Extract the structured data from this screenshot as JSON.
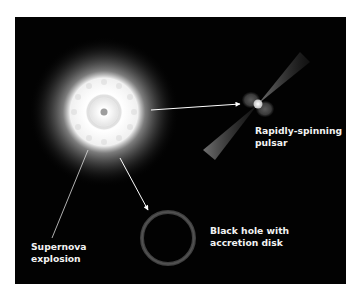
{
  "diagram": {
    "background_color": "#020202",
    "accent_color": "#ffffff",
    "nodes": [
      {
        "id": "supernova",
        "label_lines": [
          "Supernova",
          "explosion"
        ],
        "icon": "supernova-icon"
      },
      {
        "id": "pulsar",
        "label_lines": [
          "Rapidly-spinning",
          "pulsar"
        ],
        "icon": "pulsar-icon"
      },
      {
        "id": "black_hole",
        "label_lines": [
          "Black hole with",
          "accretion disk"
        ],
        "icon": "black-hole-icon"
      }
    ],
    "edges": [
      {
        "from": "supernova",
        "to": "pulsar",
        "style": "arrow"
      },
      {
        "from": "supernova",
        "to": "black_hole",
        "style": "arrow"
      }
    ]
  }
}
